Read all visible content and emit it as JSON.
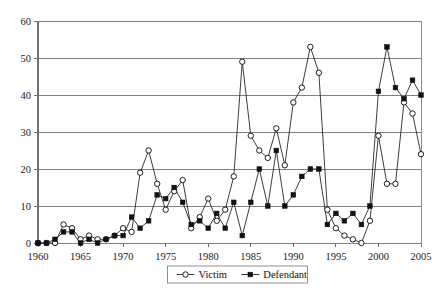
{
  "chart_data": {
    "type": "line",
    "title": "",
    "subtitle": "",
    "xlabel": "",
    "ylabel": "",
    "xlim": [
      1960,
      2005
    ],
    "ylim": [
      0,
      60
    ],
    "grid": true,
    "legend_position": "bottom-center",
    "y_ticks": [
      0,
      10,
      20,
      30,
      40,
      50,
      60
    ],
    "y_tick_labels": [
      "0",
      "10",
      "20",
      "30",
      "40",
      "50",
      "60"
    ],
    "x_ticks": [
      1960,
      1965,
      1970,
      1975,
      1980,
      1985,
      1990,
      1995,
      2000,
      2005
    ],
    "x_tick_labels": [
      "1960",
      "1965",
      "1970",
      "1975",
      "1980",
      "1985",
      "1990",
      "1995",
      "2000",
      "2005"
    ],
    "x": [
      1960,
      1961,
      1962,
      1963,
      1964,
      1965,
      1966,
      1967,
      1968,
      1969,
      1970,
      1971,
      1972,
      1973,
      1974,
      1975,
      1976,
      1977,
      1978,
      1979,
      1980,
      1981,
      1982,
      1983,
      1984,
      1985,
      1986,
      1987,
      1988,
      1989,
      1990,
      1991,
      1992,
      1993,
      1994,
      1995,
      1996,
      1997,
      1998,
      1999,
      2000,
      2001,
      2002,
      2003,
      2004,
      2005
    ],
    "series": [
      {
        "name": "Victim",
        "marker": "open-circle",
        "values": [
          0,
          0,
          0,
          5,
          4,
          1,
          2,
          1,
          1,
          2,
          4,
          3,
          19,
          25,
          16,
          9,
          14,
          17,
          4,
          7,
          12,
          6,
          9,
          18,
          49,
          29,
          25,
          23,
          31,
          21,
          38,
          42,
          53,
          46,
          9,
          4,
          2,
          1,
          0,
          6,
          29,
          16,
          16,
          38,
          35,
          24
        ]
      },
      {
        "name": "Defendant",
        "marker": "filled-square",
        "values": [
          0,
          0,
          1,
          3,
          3,
          0,
          1,
          0,
          1,
          2,
          2,
          7,
          4,
          6,
          13,
          12,
          15,
          11,
          5,
          6,
          4,
          8,
          4,
          11,
          2,
          11,
          20,
          10,
          25,
          10,
          13,
          18,
          20,
          20,
          5,
          8,
          6,
          8,
          5,
          10,
          41,
          53,
          42,
          39,
          44,
          40
        ]
      }
    ]
  },
  "legend": {
    "items": [
      {
        "label": "Victim",
        "marker": "open-circle"
      },
      {
        "label": "Defendant",
        "marker": "filled-square"
      }
    ]
  }
}
